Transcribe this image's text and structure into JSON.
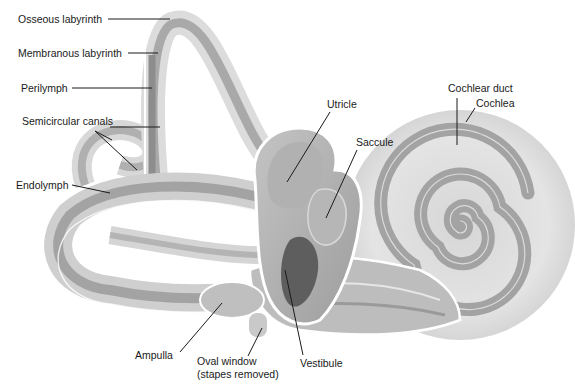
{
  "diagram": {
    "palette": {
      "background": "#ffffff",
      "outer_bone": "#e2e2e2",
      "membrane": "#b9b9b9",
      "duct_dark": "#8f8f8f",
      "vestibule_dark": "#5e5e5e",
      "outline": "#ffffff",
      "leader": "#1a1a1a"
    },
    "labels": {
      "osseous_labyrinth": "Osseous labyrinth",
      "membranous_labyrinth": "Membranous labyrinth",
      "perilymph": "Perilymph",
      "semicircular_canals": "Semicircular canals",
      "endolymph": "Endolymph",
      "utricle": "Utricle",
      "saccule": "Saccule",
      "cochlear_duct": "Cochlear duct",
      "cochlea": "Cochlea",
      "ampulla": "Ampulla",
      "oval_window_line1": "Oval window",
      "oval_window_line2": "(stapes removed)",
      "vestibule": "Vestibule"
    }
  }
}
